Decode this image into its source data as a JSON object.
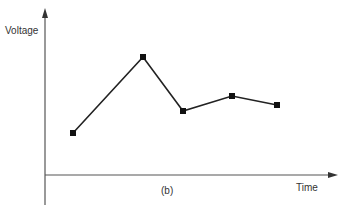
{
  "chart_data": {
    "type": "line",
    "title": "",
    "caption": "(b)",
    "xlabel": "Time",
    "ylabel": "Voltage",
    "grid": false,
    "legend": null,
    "x": [
      1,
      2,
      3,
      4,
      5
    ],
    "series": [
      {
        "name": "Voltage",
        "values": [
          0.35,
          0.85,
          0.47,
          0.56,
          0.5
        ],
        "marker": "square"
      }
    ],
    "ylim": [
      0,
      1
    ],
    "xlim": [
      0,
      6
    ],
    "axes_ticks": "none"
  },
  "labels": {
    "ylabel": "Voltage",
    "xlabel": "Time",
    "caption": "(b)"
  },
  "colors": {
    "line": "#222222",
    "axis": "#555555"
  }
}
